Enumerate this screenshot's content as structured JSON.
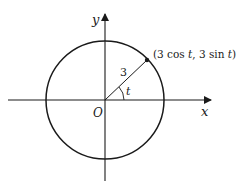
{
  "diagram": {
    "type": "parametric-circle",
    "colors": {
      "stroke": "#1a1a1a",
      "background": "#ffffff"
    },
    "axes": {
      "x_label": "x",
      "y_label": "y",
      "origin_label": "O"
    },
    "circle": {
      "radius_label": "3"
    },
    "angle_label": "t",
    "point_label_parts": {
      "open": "(3 cos ",
      "t1": "t",
      "mid": ", 3 sin ",
      "t2": "t",
      "close": ")"
    },
    "point_label": "(3 cos t, 3 sin t)"
  }
}
